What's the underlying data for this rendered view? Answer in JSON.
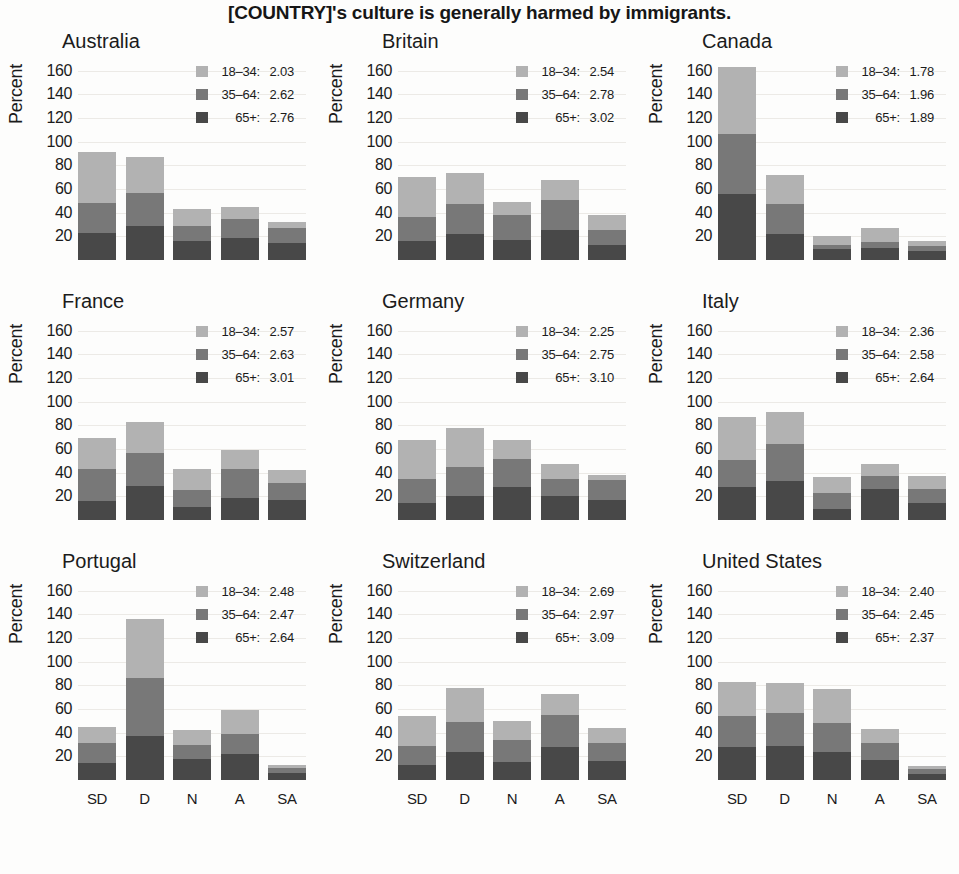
{
  "figure": {
    "title": "[COUNTRY]'s culture is generally harmed by immigrants.",
    "ylabel": "Percent",
    "yticks": [
      "160",
      "140",
      "120",
      "100",
      "80",
      "60",
      "40",
      "20"
    ],
    "xticks": [
      "SD",
      "D",
      "N",
      "A",
      "SA"
    ],
    "colors": {
      "age_18_34": "#b2b2b2",
      "age_35_64": "#787878",
      "age_65_plus": "#484848",
      "background": "#fdfdfc",
      "gridline": "#eceae6",
      "text": "#1b1b1b"
    },
    "legend_labels": {
      "age_18_34": "18–34:",
      "age_35_64": "35–64:",
      "age_65_plus": "65+:"
    }
  },
  "chart_data": {
    "type": "bar",
    "subtype": "stacked",
    "title": "[COUNTRY]'s culture is generally harmed by immigrants.",
    "xlabel": "",
    "ylabel": "Percent",
    "ylim": [
      0,
      170
    ],
    "yticks": [
      20,
      40,
      60,
      80,
      100,
      120,
      140,
      160
    ],
    "grid": true,
    "legend_position": "top-right inside panel",
    "categories": [
      "SD",
      "D",
      "N",
      "A",
      "SA"
    ],
    "series_names": [
      "18–34",
      "35–64",
      "65+"
    ],
    "panels": [
      {
        "name": "Australia",
        "means": {
          "age_18_34": "2.03",
          "age_35_64": "2.62",
          "age_65_plus": "2.76"
        },
        "series": [
          {
            "name": "65+",
            "values": [
              23,
              29,
              16,
              19,
              14
            ]
          },
          {
            "name": "35–64",
            "values": [
              25,
              28,
              13,
              16,
              13
            ]
          },
          {
            "name": "18–34",
            "values": [
              43,
              30,
              14,
              10,
              5
            ]
          }
        ],
        "totals": [
          91,
          87,
          43,
          45,
          32
        ]
      },
      {
        "name": "Britain",
        "means": {
          "age_18_34": "2.54",
          "age_35_64": "2.78",
          "age_65_plus": "3.02"
        },
        "series": [
          {
            "name": "65+",
            "values": [
              16,
              22,
              17,
              25,
              13
            ]
          },
          {
            "name": "35–64",
            "values": [
              20,
              25,
              21,
              26,
              12
            ]
          },
          {
            "name": "18–34",
            "values": [
              34,
              27,
              11,
              17,
              13
            ]
          }
        ],
        "totals": [
          70,
          74,
          49,
          68,
          38
        ]
      },
      {
        "name": "Canada",
        "means": {
          "age_18_34": "1.78",
          "age_35_64": "1.96",
          "age_65_plus": "1.89"
        },
        "series": [
          {
            "name": "65+",
            "values": [
              56,
              22,
              9,
              10,
              8
            ]
          },
          {
            "name": "35–64",
            "values": [
              51,
              25,
              4,
              5,
              4
            ]
          },
          {
            "name": "18–34",
            "values": [
              56,
              25,
              7,
              12,
              4
            ]
          }
        ],
        "totals": [
          163,
          72,
          20,
          27,
          16
        ]
      },
      {
        "name": "France",
        "means": {
          "age_18_34": "2.57",
          "age_35_64": "2.63",
          "age_65_plus": "3.01"
        },
        "series": [
          {
            "name": "65+",
            "values": [
              16,
              29,
              11,
              19,
              17
            ]
          },
          {
            "name": "35–64",
            "values": [
              27,
              28,
              14,
              24,
              14
            ]
          },
          {
            "name": "18–34",
            "values": [
              26,
              26,
              18,
              16,
              11
            ]
          }
        ],
        "totals": [
          69,
          83,
          43,
          59,
          42
        ]
      },
      {
        "name": "Germany",
        "means": {
          "age_18_34": "2.25",
          "age_35_64": "2.75",
          "age_65_plus": "3.10"
        },
        "series": [
          {
            "name": "65+",
            "values": [
              14,
              20,
              28,
              20,
              17
            ]
          },
          {
            "name": "35–64",
            "values": [
              21,
              25,
              24,
              15,
              17
            ]
          },
          {
            "name": "18–34",
            "values": [
              33,
              33,
              16,
              12,
              4
            ]
          }
        ],
        "totals": [
          68,
          78,
          68,
          47,
          38
        ]
      },
      {
        "name": "Italy",
        "means": {
          "age_18_34": "2.36",
          "age_35_64": "2.58",
          "age_65_plus": "2.64"
        },
        "series": [
          {
            "name": "65+",
            "values": [
              28,
              33,
              9,
              26,
              14
            ]
          },
          {
            "name": "35–64",
            "values": [
              23,
              31,
              14,
              11,
              12
            ]
          },
          {
            "name": "18–34",
            "values": [
              36,
              27,
              13,
              10,
              11
            ]
          }
        ],
        "totals": [
          87,
          91,
          36,
          47,
          37
        ]
      },
      {
        "name": "Portugal",
        "means": {
          "age_18_34": "2.48",
          "age_35_64": "2.47",
          "age_65_plus": "2.64"
        },
        "series": [
          {
            "name": "65+",
            "values": [
              14,
              37,
              18,
              22,
              6
            ]
          },
          {
            "name": "35–64",
            "values": [
              17,
              49,
              12,
              17,
              4
            ]
          },
          {
            "name": "18–34",
            "values": [
              14,
              50,
              12,
              20,
              3
            ]
          }
        ],
        "totals": [
          45,
          136,
          42,
          59,
          13
        ]
      },
      {
        "name": "Switzerland",
        "means": {
          "age_18_34": "2.69",
          "age_35_64": "2.97",
          "age_65_plus": "3.09"
        },
        "series": [
          {
            "name": "65+",
            "values": [
              13,
              24,
              15,
              28,
              16
            ]
          },
          {
            "name": "35–64",
            "values": [
              16,
              25,
              19,
              27,
              15
            ]
          },
          {
            "name": "18–34",
            "values": [
              25,
              29,
              16,
              18,
              13
            ]
          }
        ],
        "totals": [
          54,
          78,
          50,
          73,
          44
        ]
      },
      {
        "name": "United States",
        "means": {
          "age_18_34": "2.40",
          "age_35_64": "2.45",
          "age_65_plus": "2.37"
        },
        "series": [
          {
            "name": "65+",
            "values": [
              28,
              29,
              24,
              17,
              5
            ]
          },
          {
            "name": "35–64",
            "values": [
              26,
              28,
              24,
              14,
              4
            ]
          },
          {
            "name": "18–34",
            "values": [
              29,
              25,
              29,
              12,
              3
            ]
          }
        ],
        "totals": [
          83,
          82,
          77,
          43,
          12
        ]
      }
    ]
  }
}
